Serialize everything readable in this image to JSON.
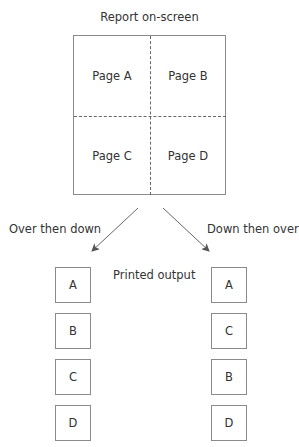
{
  "diagram": {
    "title": "Report on-screen",
    "pages": [
      {
        "label": "Page A",
        "position": "top-left"
      },
      {
        "label": "Page B",
        "position": "top-right"
      },
      {
        "label": "Page C",
        "position": "bottom-left"
      },
      {
        "label": "Page D",
        "position": "bottom-right"
      }
    ],
    "left_branch": {
      "label": "Over then down",
      "order": [
        "A",
        "B",
        "C",
        "D"
      ]
    },
    "right_branch": {
      "label": "Down then over",
      "order": [
        "A",
        "C",
        "B",
        "D"
      ]
    },
    "center_label": "Printed output"
  }
}
